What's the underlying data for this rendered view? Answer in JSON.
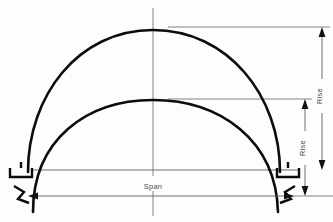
{
  "diagram": {
    "type": "engineering-line-drawing",
    "background_color": "#fdfdfd",
    "line_color": "#0c0c0c",
    "dimension_color": "#5d5d5d",
    "labels": {
      "span": "Span",
      "rise_outer": "Rise",
      "rise_inner": "Rise"
    },
    "elements": {
      "outer_arch_name": "outer-arch-curve",
      "inner_arch_name": "inner-arch-curve",
      "left_support_name": "left-support-block",
      "right_support_name": "right-support-block",
      "centerline_name": "vertical-centerline",
      "baseline_name": "springing-baseline"
    },
    "geometry": {
      "centerline_x": 153,
      "outer_apex_y": 30,
      "inner_apex_y": 100,
      "springing_y": 170,
      "outer_left_x": 28,
      "outer_right_x": 280,
      "inner_left_x": 52,
      "inner_right_x": 258,
      "span_dim_y": 196,
      "rise_outer_dim_x": 322,
      "rise_inner_dim_x": 305
    }
  }
}
